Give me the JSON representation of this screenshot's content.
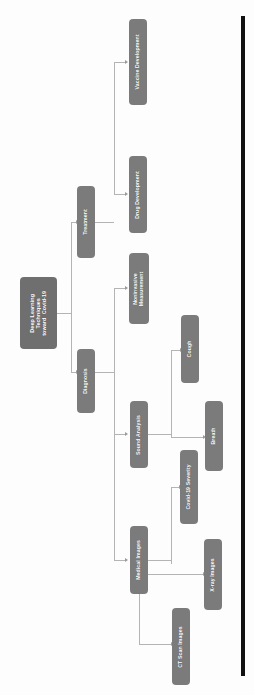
{
  "diagram": {
    "type": "tree",
    "orientation": "rotated-90-ccw",
    "title_node": "Deep Learning Techniques toward Covid-19",
    "node_color": "#7b7b7b",
    "root_color": "#6f6f6f",
    "label_color": "#ffffff",
    "edge_color": "#b4b4b4",
    "rule_color": "#111111",
    "background": "#fdfdfd",
    "nodes": {
      "root": "Deep Learning\nTechniques\ntoward  Covid-19",
      "treatment": "Treatment",
      "diagnosis": "Diagnosis",
      "vaccine_development": "Vaccine Development",
      "drug_development": "Drug Development",
      "noninvasive_measurement": "Noninvasive\nMeasurement",
      "sound_analysis": "Sound Analysis",
      "medical_images": "Medical Images",
      "cough": "Cough",
      "breath": "Breath",
      "covid19_severity": "Covid-19 Severity",
      "xray_images": "X-ray Images",
      "ct_scan_images": "CT Scan Images"
    },
    "edges": [
      {
        "from": "root",
        "to": "treatment"
      },
      {
        "from": "root",
        "to": "diagnosis"
      },
      {
        "from": "treatment",
        "to": "vaccine_development"
      },
      {
        "from": "treatment",
        "to": "drug_development"
      },
      {
        "from": "diagnosis",
        "to": "noninvasive_measurement"
      },
      {
        "from": "diagnosis",
        "to": "sound_analysis"
      },
      {
        "from": "diagnosis",
        "to": "medical_images"
      },
      {
        "from": "sound_analysis",
        "to": "cough"
      },
      {
        "from": "sound_analysis",
        "to": "breath"
      },
      {
        "from": "medical_images",
        "to": "covid19_severity"
      },
      {
        "from": "medical_images",
        "to": "xray_images"
      },
      {
        "from": "medical_images",
        "to": "ct_scan_images"
      }
    ]
  }
}
